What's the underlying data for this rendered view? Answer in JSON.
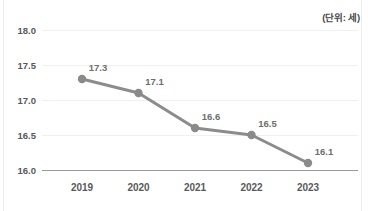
{
  "unit_note": "(단위: 세)",
  "style": {
    "line_color": "#8c8c8c",
    "marker_color": "#8a8a8a",
    "grid_color": "#f0f0f0",
    "baseline_color": "#9a9a9a",
    "tick_label_color": "#59595b",
    "data_label_color": "#6e6e70",
    "background": "#ffffff"
  },
  "chart_data": {
    "type": "line",
    "title": "",
    "subtitle": "",
    "xlabel": "",
    "ylabel": "",
    "unit": "(단위: 세)",
    "categories": [
      "2019",
      "2020",
      "2021",
      "2022",
      "2023"
    ],
    "values": [
      17.3,
      17.1,
      16.6,
      16.5,
      16.1
    ],
    "data_labels": [
      "17.3",
      "17.1",
      "16.6",
      "16.5",
      "16.1"
    ],
    "ylim": [
      16.0,
      18.0
    ],
    "ytick_values": [
      18.0,
      17.5,
      17.0,
      16.5,
      16.0
    ],
    "ytick_labels": [
      "18.0",
      "17.5",
      "17.0",
      "16.5",
      "16.0"
    ],
    "grid": "horizontal",
    "legend": "none",
    "markers": true,
    "series": [
      {
        "name": "",
        "values": [
          17.3,
          17.1,
          16.6,
          16.5,
          16.1
        ]
      }
    ]
  }
}
